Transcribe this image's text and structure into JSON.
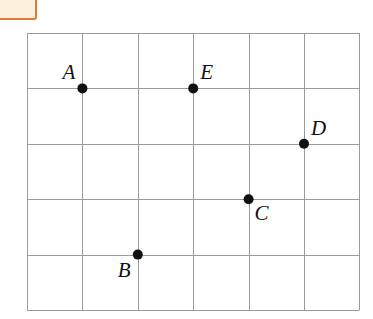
{
  "grid": {
    "columns": 6,
    "rows": 5,
    "line_color": "#9a9a9a"
  },
  "corner_box": {
    "fill": "#fdf0dc",
    "border": "#e07a36"
  },
  "points": [
    {
      "label": "A",
      "col": 1,
      "row": 1,
      "label_pos": "upper-left"
    },
    {
      "label": "E",
      "col": 3,
      "row": 1,
      "label_pos": "upper-right"
    },
    {
      "label": "D",
      "col": 5,
      "row": 2,
      "label_pos": "upper-right"
    },
    {
      "label": "C",
      "col": 4,
      "row": 3,
      "label_pos": "lower-right"
    },
    {
      "label": "B",
      "col": 2,
      "row": 4,
      "label_pos": "lower-left"
    }
  ]
}
